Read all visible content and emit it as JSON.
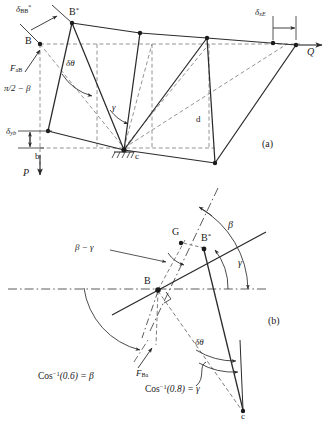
{
  "figure": {
    "panel_a_label": "(a)",
    "panel_b_label": "(b)"
  },
  "panel_a": {
    "nodes": {
      "B": "B",
      "B_star": "B",
      "b": "b",
      "c": "c",
      "d": "d"
    },
    "labels": {
      "delta_BBstar": "δ",
      "delta_BBstar_sub": "BB",
      "delta_BBstar_sup": "*",
      "delta_xE": "δ",
      "delta_xE_sub": "xE",
      "delta_yb": "δ",
      "delta_yb_sub": "yb",
      "F_aB": "F",
      "F_aB_sub": "aB",
      "pi_half_minus_beta": "π/2 − β",
      "delta_theta": "δθ",
      "gamma": "γ",
      "Q": "Q",
      "P": "P",
      "B_star_sup": "*"
    }
  },
  "panel_b": {
    "nodes": {
      "B": "B",
      "B_star": "B",
      "B_star_sup": "*",
      "G": "G",
      "c": "c"
    },
    "labels": {
      "beta": "β",
      "gamma": "γ",
      "beta_minus_gamma": "β − γ",
      "delta_theta": "δθ",
      "F_Ba": "F",
      "F_Ba_sub": "Ba",
      "cos_beta_pre": "Cos",
      "cos_beta_sup": "−1",
      "cos_beta_post": "(0.6) = β",
      "cos_gamma_pre": "Cos",
      "cos_gamma_sup": "−1",
      "cos_gamma_post": "(0.8) = γ"
    }
  },
  "style": {
    "line_color": "#2b2b2b",
    "dash_color": "#6e6e6e",
    "background": "#ffffff"
  }
}
